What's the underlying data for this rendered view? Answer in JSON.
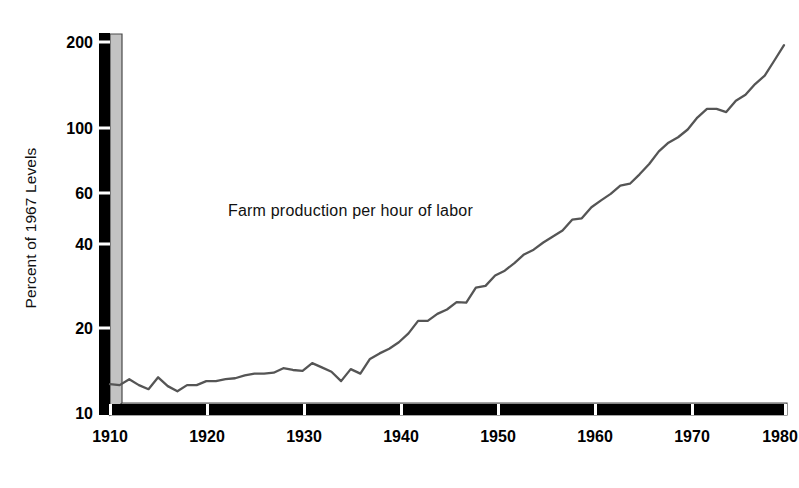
{
  "chart_data": {
    "type": "line",
    "title": "",
    "annotations": [
      {
        "name": "series-label",
        "text": "Farm production per hour of labor",
        "x": 1932,
        "y": 47
      }
    ],
    "xlabel": "",
    "ylabel": "Percent of 1967 Levels",
    "yscale": "log",
    "ylim": [
      10,
      200
    ],
    "xlim": [
      1910,
      1980
    ],
    "grid": false,
    "legend": null,
    "ytick_labels": [
      "200",
      "100",
      "60",
      "40",
      "20",
      "10"
    ],
    "ytick_values": [
      200,
      100,
      60,
      40,
      20,
      10
    ],
    "xtick_labels": [
      "1910",
      "1920",
      "1930",
      "1940",
      "1950",
      "1960",
      "1970",
      "1980"
    ],
    "xtick_values": [
      1910,
      1920,
      1930,
      1940,
      1950,
      1960,
      1970,
      1980
    ],
    "series": [
      {
        "name": "Farm production per hour of labor",
        "color": "#555555",
        "x": [
          1910,
          1911,
          1912,
          1913,
          1914,
          1915,
          1916,
          1917,
          1918,
          1919,
          1920,
          1921,
          1922,
          1923,
          1924,
          1925,
          1926,
          1927,
          1928,
          1929,
          1930,
          1931,
          1932,
          1933,
          1934,
          1935,
          1936,
          1937,
          1938,
          1939,
          1940,
          1941,
          1942,
          1943,
          1944,
          1945,
          1946,
          1947,
          1948,
          1949,
          1950,
          1951,
          1952,
          1953,
          1954,
          1955,
          1956,
          1957,
          1958,
          1959,
          1960,
          1961,
          1962,
          1963,
          1964,
          1965,
          1966,
          1967,
          1968,
          1969,
          1970,
          1971,
          1972,
          1973,
          1974,
          1975,
          1976,
          1977,
          1978,
          1979,
          1980
        ],
        "y": [
          12.3,
          12.2,
          12.8,
          12.2,
          11.8,
          13.0,
          12.1,
          11.6,
          12.2,
          12.2,
          12.6,
          12.6,
          12.8,
          12.9,
          13.2,
          13.4,
          13.4,
          13.5,
          14.0,
          13.8,
          13.7,
          14.6,
          14.1,
          13.6,
          12.6,
          13.9,
          13.4,
          15.1,
          15.8,
          16.4,
          17.3,
          18.6,
          20.6,
          20.6,
          21.8,
          22.6,
          24.0,
          23.9,
          27.0,
          27.4,
          29.8,
          31.0,
          33.0,
          35.4,
          36.8,
          39.0,
          41.0,
          43.0,
          47.0,
          47.5,
          52.0,
          55.0,
          58.0,
          62.0,
          63.0,
          68.0,
          74.0,
          82.0,
          88.0,
          92.0,
          98.0,
          108.0,
          116.0,
          116.0,
          113.0,
          124.0,
          130.0,
          142.0,
          152.0,
          172.0,
          195.0
        ]
      }
    ]
  },
  "axis_style": {
    "bar_color": "#000000",
    "band_color": "#c3c3c3",
    "band_edge_color": "#4a4a4a",
    "tick_gap_color": "#ffffff"
  }
}
